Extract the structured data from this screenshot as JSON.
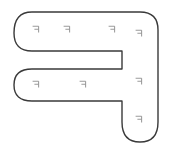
{
  "figure": {
    "title": "",
    "canvas": {
      "width": 176,
      "height": 154
    },
    "background_color": "#ffffff"
  },
  "shape": {
    "name": "f-shaped-polygon",
    "stroke_color": "#3a3a3a",
    "stroke_width": 1.4,
    "fill_color": "#ffffff",
    "corner_radius": 18,
    "path": "M 32 12 L 140 12 Q 158 12 158 30 L 158 122 Q 158 142 140 142 Q 122 142 122 122 L 122 101 L 32 101 Q 14 101 14 85 Q 14 69 32 69 L 122 69 L 122 51 L 32 51 Q 14 51 14 33 Q 14 12 32 12 Z",
    "segments": [
      {
        "name": "top-arm",
        "orientation": "horizontal"
      },
      {
        "name": "middle-notch",
        "orientation": "horizontal"
      },
      {
        "name": "lower-arm",
        "orientation": "horizontal"
      },
      {
        "name": "right-stem",
        "orientation": "vertical"
      }
    ]
  },
  "glyphs": {
    "symbol_name": "mirrored-f-mark",
    "color": "#9a9a9a",
    "count": 7,
    "items": [
      {
        "id": "mark-1",
        "x": 31,
        "y": 25,
        "region": "top-arm"
      },
      {
        "id": "mark-2",
        "x": 62,
        "y": 25,
        "region": "top-arm"
      },
      {
        "id": "mark-3",
        "x": 107,
        "y": 25,
        "region": "top-arm"
      },
      {
        "id": "mark-4",
        "x": 134,
        "y": 29,
        "region": "right-stem"
      },
      {
        "id": "mark-5",
        "x": 31,
        "y": 80,
        "region": "lower-arm"
      },
      {
        "id": "mark-6",
        "x": 78,
        "y": 80,
        "region": "lower-arm"
      },
      {
        "id": "mark-7",
        "x": 134,
        "y": 77,
        "region": "right-stem"
      },
      {
        "id": "mark-8",
        "x": 134,
        "y": 115,
        "region": "right-stem"
      }
    ]
  }
}
